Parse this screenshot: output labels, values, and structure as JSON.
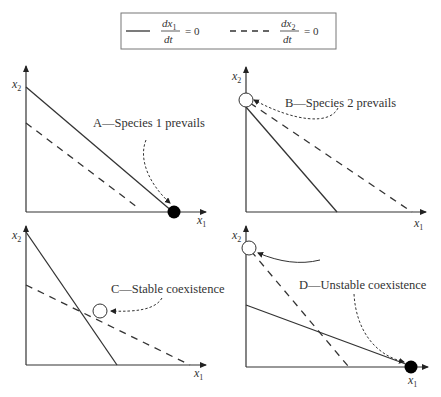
{
  "legend": {
    "solid": {
      "numerator": "dx",
      "sub": "1",
      "denominator": "dt",
      "equals": "= 0",
      "style": "solid"
    },
    "dashed": {
      "numerator": "dx",
      "sub": "2",
      "denominator": "dt",
      "equals": "= 0",
      "style": "dashed"
    }
  },
  "axes": {
    "x_label": "x",
    "x_sub": "1",
    "y_label": "x",
    "y_sub": "2"
  },
  "panels": [
    {
      "id": "A",
      "caption": "A—Species 1 prevails",
      "equilibrium": "stable at x1-axis intercept (filled)"
    },
    {
      "id": "B",
      "caption": "B—Species 2 prevails",
      "equilibrium": "stable at x2-axis intercept (open)"
    },
    {
      "id": "C",
      "caption": "C—Stable coexistence",
      "equilibrium": "interior intersection (open)"
    },
    {
      "id": "D",
      "caption": "D—Unstable coexistence",
      "equilibrium": "two boundary equilibria (open on x2, filled on x1)"
    }
  ],
  "colors": {
    "line": "#333333",
    "background": "#ffffff",
    "filled_point": "#000000",
    "open_point_fill": "#ffffff"
  }
}
